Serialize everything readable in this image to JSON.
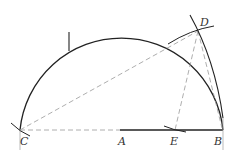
{
  "diagram": {
    "type": "geometric-construction",
    "points": {
      "C": {
        "label": "C",
        "x": 20,
        "y": 130
      },
      "A": {
        "label": "A",
        "x": 120,
        "y": 130
      },
      "E": {
        "label": "E",
        "x": 173,
        "y": 130
      },
      "B": {
        "label": "B",
        "x": 223,
        "y": 130
      },
      "D": {
        "label": "D",
        "x": 198,
        "y": 31
      }
    },
    "colors": {
      "solid": "#222222",
      "dashed": "#888888",
      "label": "#333333"
    }
  }
}
